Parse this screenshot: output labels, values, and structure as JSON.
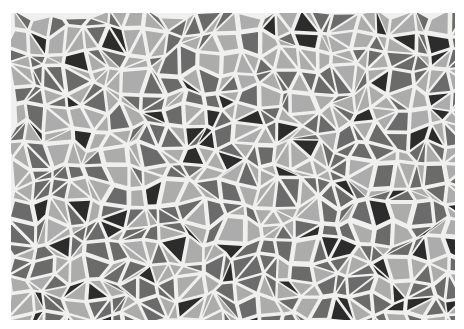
{
  "image": {
    "subject": "mosaic tile pattern",
    "description": "Irregular polygonal tiles in light, medium and dark gray separated by white grout",
    "palette": {
      "grout": "#f0f0ee",
      "light": "#acacac",
      "medium": "#6b6b6b",
      "dark": "#2c2c2c",
      "border": "#ffffff"
    }
  }
}
